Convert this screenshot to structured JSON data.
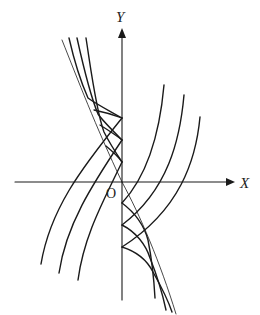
{
  "figure": {
    "type": "mathematical-diagram",
    "axes": {
      "x_label": "X",
      "y_label": "Y",
      "origin_label": "O"
    },
    "colors": {
      "stroke": "#1a1a1a",
      "background": "#ffffff"
    },
    "curve_families": [
      {
        "name": "upper-left",
        "count": 3,
        "cusps_on_y_axis": 3
      },
      {
        "name": "lower-right",
        "count": 3,
        "cusps_on_y_axis": 3
      }
    ]
  }
}
